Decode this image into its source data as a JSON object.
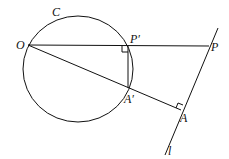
{
  "figure": {
    "labels": {
      "circle": "C",
      "origin": "O",
      "p_prime": "P′",
      "p": "P",
      "a_prime": "A′",
      "a": "A",
      "line": "l"
    },
    "stroke_color": "#111111"
  }
}
